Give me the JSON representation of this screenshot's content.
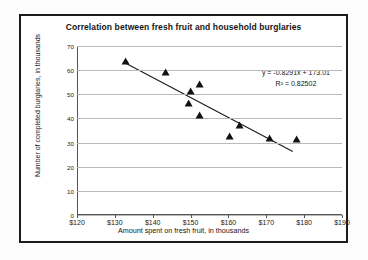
{
  "chart_data": {
    "type": "scatter",
    "title": "Correlation between fresh fruit and household burglaries",
    "xlabel": "Amount spent on fresh fruit, in thousands",
    "ylabel": "Number of completed burglaries, in thousands",
    "xlim": [
      120,
      190
    ],
    "ylim": [
      0,
      70
    ],
    "xticks": [
      "$120",
      "$130",
      "$140",
      "$150",
      "$160",
      "$170",
      "$180",
      "$190"
    ],
    "xtick_values": [
      120,
      130,
      140,
      150,
      160,
      170,
      180,
      190
    ],
    "yticks": [
      "0",
      "10",
      "20",
      "30",
      "40",
      "50",
      "60",
      "70"
    ],
    "ytick_values": [
      0,
      10,
      20,
      30,
      40,
      50,
      60,
      70
    ],
    "grid": "horizontal",
    "legend": "none",
    "marker": "triangle",
    "marker_color": "#121212",
    "points": [
      {
        "x": 133.0,
        "y": 63.0
      },
      {
        "x": 143.5,
        "y": 58.5
      },
      {
        "x": 149.5,
        "y": 45.5
      },
      {
        "x": 150.0,
        "y": 50.5
      },
      {
        "x": 152.5,
        "y": 53.5
      },
      {
        "x": 152.5,
        "y": 40.5
      },
      {
        "x": 160.5,
        "y": 32.0
      },
      {
        "x": 163.0,
        "y": 36.5
      },
      {
        "x": 171.0,
        "y": 31.0
      },
      {
        "x": 178.0,
        "y": 30.5
      }
    ],
    "trendline": {
      "slope": -0.8291,
      "intercept": 173.01,
      "x_start": 133.0,
      "x_end": 177.0,
      "color": "#1a1a1a"
    },
    "annotations": {
      "equation": "y = -0.8291x + 173.01",
      "r_squared": "R² = 0.82502"
    }
  }
}
